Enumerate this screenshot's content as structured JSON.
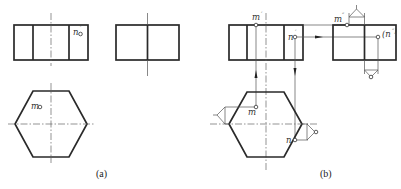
{
  "figure": {
    "panels": [
      {
        "caption": "(a)",
        "front_view": {
          "point_labels": [
            {
              "name": "n",
              "mark": "′"
            }
          ]
        },
        "side_view": {
          "point_labels": []
        },
        "top_view": {
          "point_labels": [
            {
              "name": "m",
              "mark": ""
            }
          ]
        }
      },
      {
        "caption": "(b)",
        "front_view": {
          "point_labels": [
            {
              "name": "m",
              "mark": "′"
            },
            {
              "name": "n",
              "mark": "′"
            }
          ]
        },
        "side_view": {
          "point_labels": [
            {
              "name": "m",
              "mark": "″"
            },
            {
              "name": "(n",
              "mark": "″)"
            }
          ]
        },
        "top_view": {
          "point_labels": [
            {
              "name": "m",
              "mark": ""
            },
            {
              "name": "n",
              "mark": ""
            }
          ]
        }
      }
    ]
  },
  "labels": {
    "a_front_n": "n",
    "a_front_n_mark": "′",
    "a_top_m": "m",
    "b_front_m": "m",
    "b_front_m_mark": "′",
    "b_front_n": "n",
    "b_front_n_mark": "′",
    "b_side_m": "m",
    "b_side_m_mark": "″",
    "b_side_n": "(n",
    "b_side_n_mark": "″)",
    "b_top_m": "m",
    "b_top_n": "n",
    "caption_a": "(a)",
    "caption_b": "(b)"
  },
  "colors": {
    "outline": "#2a2a2a",
    "thin_line": "#555555",
    "background": "#ffffff"
  }
}
